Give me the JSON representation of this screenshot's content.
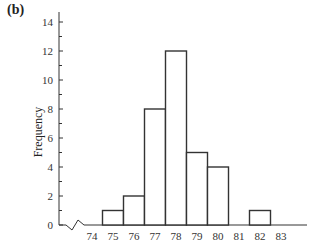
{
  "panel_label": "(b)",
  "chart_data": {
    "type": "bar",
    "subtype": "histogram",
    "title": "",
    "xlabel": "",
    "ylabel": "Frequency",
    "categories": [
      "75",
      "76",
      "77",
      "78",
      "79",
      "80",
      "81",
      "82"
    ],
    "values": [
      1,
      2,
      8,
      12,
      5,
      4,
      0,
      1
    ],
    "x_ticks": [
      "74",
      "75",
      "76",
      "77",
      "78",
      "79",
      "80",
      "81",
      "82",
      "83"
    ],
    "y_ticks": [
      "0",
      "2",
      "4",
      "6",
      "8",
      "10",
      "12",
      "14"
    ],
    "ylim": [
      0,
      14
    ],
    "xlim": [
      74,
      83
    ],
    "axis_break": "zigzag between 0 and 74 on x-axis",
    "grid": false,
    "legend": null,
    "bar_fill": "#ffffff",
    "bar_stroke": "#333333"
  }
}
